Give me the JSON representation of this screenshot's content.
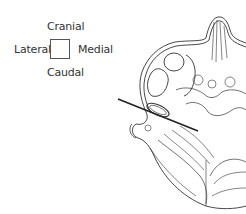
{
  "orientation_legend": {
    "top": "Cranial",
    "left": "Lateral",
    "right": "Medial",
    "bottom": "Caudal"
  },
  "figure": {
    "line_color": "#333333",
    "background": "#ffffff"
  }
}
